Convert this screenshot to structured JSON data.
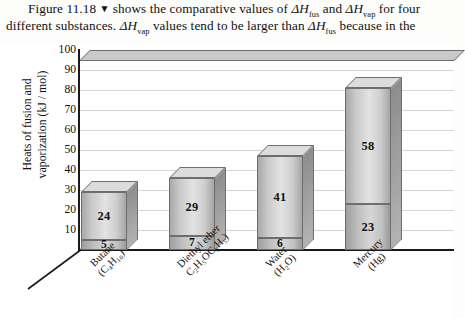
{
  "caption": {
    "line1": "Figure 11.18 ▼ shows the comparative values of ΔHfus and ΔHvap for four",
    "line2": "different substances. ΔHvap values tend to be larger than ΔHfus because in the",
    "figure_number": "Figure 11.18",
    "triangle_glyph": "▼"
  },
  "chart_data": {
    "type": "bar",
    "stacked": true,
    "title": "",
    "xlabel": "",
    "ylabel": "Heats of fusion and vaporization (kJ / mol)",
    "ylabel_line1": "Heats of fusion and",
    "ylabel_line2": "vaporization (kJ / mol)",
    "ylim": [
      0,
      100
    ],
    "ytick_values": [
      100,
      90,
      80,
      70,
      60,
      50,
      40,
      30,
      20,
      10
    ],
    "ytick_labels": [
      "100",
      "90",
      "80",
      "70",
      "60",
      "50",
      "40",
      "30",
      "20",
      "10"
    ],
    "grid": true,
    "legend": "none",
    "categories": [
      {
        "name": "Butane",
        "formula": "(C4H10)",
        "label_line1": "Butane",
        "label_line2": "(C₄H₁₀)"
      },
      {
        "name": "Diethyl ether",
        "formula": "C2H5OC2H5)",
        "label_line1": "Diethyl ether",
        "label_line2": "C₂H₅OC₂H₅)"
      },
      {
        "name": "Water",
        "formula": "(H2O)",
        "label_line1": "Water",
        "label_line2": "(H₂O)"
      },
      {
        "name": "Mercury",
        "formula": "(Hg)",
        "label_line1": "Mercury",
        "label_line2": "(Hg)"
      }
    ],
    "series": [
      {
        "name": "ΔHfus",
        "values": [
          5,
          7,
          6,
          23
        ],
        "labels": [
          "5",
          "7",
          "6",
          "23"
        ]
      },
      {
        "name": "ΔHvap",
        "values": [
          24,
          29,
          41,
          58
        ],
        "labels": [
          "24",
          "29",
          "41",
          "58"
        ]
      }
    ],
    "totals": [
      29,
      36,
      47,
      81
    ],
    "colors": {
      "bar_front_light": "#e2e2e2",
      "bar_front_dark": "#a5a5a5",
      "bar_side": "#8d8d8d",
      "bar_top": "#dcdcdc",
      "bar_outline": "#6e6e6e",
      "gridline": "#d4d4d4",
      "axis": "#1a1a1a",
      "background": "#ffffff"
    }
  }
}
